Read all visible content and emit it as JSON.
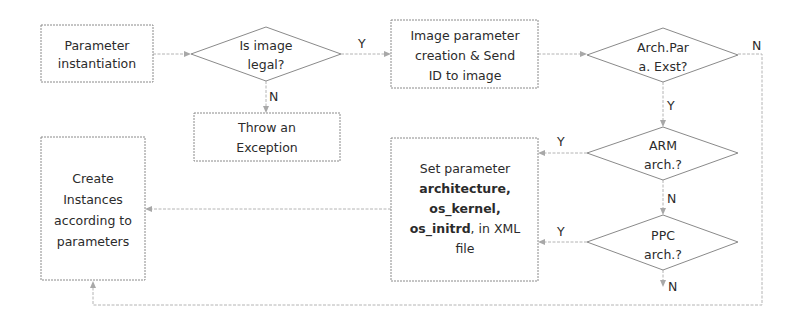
{
  "diagram": {
    "type": "flowchart",
    "nodes": {
      "param_inst": {
        "kind": "process",
        "lines": [
          "Parameter",
          "instantiation"
        ]
      },
      "is_legal": {
        "kind": "decision",
        "lines": [
          "Is image",
          "legal?"
        ]
      },
      "throw_exc": {
        "kind": "process",
        "lines": [
          "Throw an",
          "Exception"
        ]
      },
      "img_param": {
        "kind": "process",
        "lines": [
          "Image parameter",
          "creation & Send",
          "ID to image"
        ]
      },
      "arch_exist": {
        "kind": "decision",
        "lines": [
          "Arch.Par",
          "a. Exst?"
        ]
      },
      "arm_arch": {
        "kind": "decision",
        "lines": [
          "ARM",
          "arch.?"
        ]
      },
      "ppc_arch": {
        "kind": "decision",
        "lines": [
          "PPC",
          "arch.?"
        ]
      },
      "set_param": {
        "kind": "process",
        "lines": [
          [
            {
              "text": "Set parameter",
              "bold": false
            }
          ],
          [
            {
              "text": "architecture,",
              "bold": true
            }
          ],
          [
            {
              "text": "os_kernel,",
              "bold": true
            }
          ],
          [
            {
              "text": "os_initrd",
              "bold": true
            },
            {
              "text": ", in XML",
              "bold": false
            }
          ],
          [
            {
              "text": "file",
              "bold": false
            }
          ]
        ]
      },
      "create_inst": {
        "kind": "process",
        "lines": [
          "Create",
          "Instances",
          "according to",
          "parameters"
        ]
      }
    },
    "edges": [
      {
        "from": "param_inst",
        "to": "is_legal",
        "label": ""
      },
      {
        "from": "is_legal",
        "to": "img_param",
        "label": "Y"
      },
      {
        "from": "is_legal",
        "to": "throw_exc",
        "label": "N"
      },
      {
        "from": "img_param",
        "to": "arch_exist",
        "label": ""
      },
      {
        "from": "arch_exist",
        "to": "arm_arch",
        "label": "Y"
      },
      {
        "from": "arch_exist",
        "to": "create_inst",
        "label": "N"
      },
      {
        "from": "arm_arch",
        "to": "set_param",
        "label": "Y"
      },
      {
        "from": "arm_arch",
        "to": "ppc_arch",
        "label": "N"
      },
      {
        "from": "ppc_arch",
        "to": "set_param",
        "label": "Y"
      },
      {
        "from": "ppc_arch",
        "to": "",
        "label": "N"
      },
      {
        "from": "set_param",
        "to": "create_inst",
        "label": ""
      }
    ],
    "labels": {
      "legal_yes": "Y",
      "legal_no": "N",
      "exist_yes": "Y",
      "exist_no": "N",
      "arm_yes": "Y",
      "arm_no": "N",
      "ppc_yes": "Y",
      "ppc_no": "N"
    },
    "colors": {
      "stroke": "#8a8a8a",
      "edge": "#b4b4b4",
      "text": "#2b2b2b",
      "background": "#ffffff"
    }
  }
}
